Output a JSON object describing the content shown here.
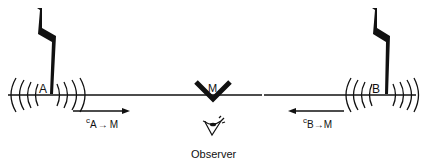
{
  "diagram": {
    "colors": {
      "ink": "#111111",
      "background": "#ffffff"
    },
    "points": {
      "a": {
        "label": "A"
      },
      "b": {
        "label": "B"
      },
      "m": {
        "label": "M"
      }
    },
    "arrows": {
      "a_to_m": {
        "prefix": "c",
        "subscript_from": "A",
        "arrow": "→",
        "subscript_to": "M",
        "direction": "right"
      },
      "b_to_m": {
        "prefix": "c",
        "subscript_from": "B",
        "arrow": "→",
        "subscript_to": "M",
        "direction": "left"
      }
    },
    "observer": {
      "label": "Observer",
      "icon": "eye-icon"
    },
    "icons": {
      "lightning_a": "lightning-bolt-icon",
      "lightning_b": "lightning-bolt-icon",
      "mirror": "v-mirror-icon"
    }
  }
}
